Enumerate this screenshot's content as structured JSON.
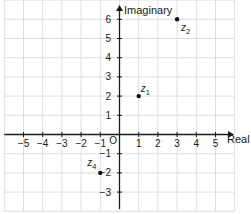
{
  "chart_data": {
    "type": "scatter",
    "title": "",
    "xlabel": "Real",
    "ylabel": "Imaginary",
    "origin_label": "O",
    "xlim": [
      -6,
      6
    ],
    "ylim": [
      -4,
      7
    ],
    "grid": true,
    "x_ticks": [
      {
        "value": -5,
        "label": "−5"
      },
      {
        "value": -4,
        "label": "−4"
      },
      {
        "value": -3,
        "label": "−3"
      },
      {
        "value": -2,
        "label": "−2"
      },
      {
        "value": -1,
        "label": "−1"
      },
      {
        "value": 1,
        "label": "1"
      },
      {
        "value": 2,
        "label": "2"
      },
      {
        "value": 3,
        "label": "3"
      },
      {
        "value": 4,
        "label": "4"
      },
      {
        "value": 5,
        "label": "5"
      }
    ],
    "y_ticks": [
      {
        "value": -3,
        "label": "−3"
      },
      {
        "value": -2,
        "label": "−2"
      },
      {
        "value": -1,
        "label": "−1"
      },
      {
        "value": 1,
        "label": "1"
      },
      {
        "value": 2,
        "label": "2"
      },
      {
        "value": 3,
        "label": "3"
      },
      {
        "value": 4,
        "label": "4"
      },
      {
        "value": 5,
        "label": "5"
      },
      {
        "value": 6,
        "label": "6"
      }
    ],
    "points": [
      {
        "name": "z1",
        "label_base": "z",
        "label_sub": "1",
        "re": 1,
        "im": 2,
        "label_side": "above-right"
      },
      {
        "name": "z2",
        "label_base": "z",
        "label_sub": "2",
        "re": 3,
        "im": 6,
        "label_side": "below-right"
      },
      {
        "name": "z4",
        "label_base": "z",
        "label_sub": "4",
        "re": -1,
        "im": -2,
        "label_side": "above-left"
      }
    ],
    "colors": {
      "background": "#ffffff",
      "grid": "#dedede",
      "axis": "#1a1a1a",
      "text": "#1a1a1a",
      "point": "#111111"
    }
  }
}
